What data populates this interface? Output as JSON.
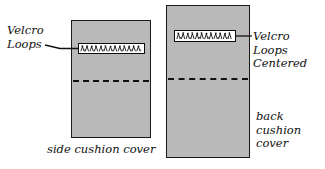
{
  "diagram": {
    "background_color": "#ffffff",
    "panel_fill_color": "#b9b9b9",
    "line_color": "#111111",
    "strip_fill_color": "#ffffff"
  },
  "panels": [
    {
      "id": "side-cushion-cover",
      "caption": "side cushion cover",
      "velcro_alignment": "right-aligned",
      "fold_line_style": "dashed"
    },
    {
      "id": "back-cushion-cover",
      "caption": "back\ncushion\ncover",
      "velcro_alignment": "centered",
      "fold_line_style": "dashed"
    }
  ],
  "labels": {
    "velcro_loops": "Velcro\nLoops",
    "velcro_loops_centered": "Velcro Loops\nCentered"
  },
  "icons": {
    "velcro_texture": "velcro-hook-texture"
  }
}
